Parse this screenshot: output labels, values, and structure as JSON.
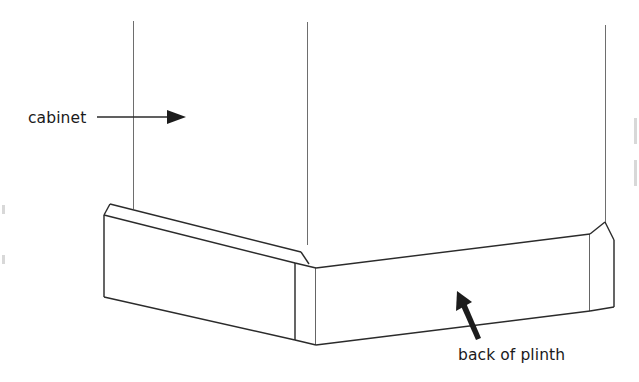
{
  "figure": {
    "background_color": "#ffffff",
    "line_color": "#2b2b2b",
    "text_color": "#1a1a1a",
    "width": 639,
    "height": 382
  },
  "labels": {
    "cabinet": {
      "text": "cabinet",
      "x": 28,
      "y": 123
    },
    "back_of_plinth": {
      "text": "back of plinth",
      "x": 458,
      "y": 360
    }
  },
  "annotations": {
    "cabinet_leader": {
      "name": "horizontal leader with right-pointing arrowhead",
      "from_x": 97,
      "from_y": 117,
      "to_x": 186,
      "to_y": 117,
      "direction": "right"
    },
    "plinth_leader": {
      "name": "diagonal leader with up-left arrowhead",
      "from_x": 479,
      "from_y": 337,
      "to_x": 457,
      "to_y": 291,
      "direction": "up-left"
    }
  },
  "geometry": {
    "cabinet_verticals": [
      {
        "name": "left-cabinet-edge",
        "x": 133,
        "y_top": 21,
        "y_bottom": 207
      },
      {
        "name": "center-cabinet-edge",
        "x": 307,
        "y_top": 22,
        "y_bottom": 243
      },
      {
        "name": "right-cabinet-edge",
        "x": 605,
        "y_top": 25,
        "y_bottom": 228
      }
    ],
    "plinth_left_face": {
      "name": "left plinth front face",
      "top_left_x": 104,
      "top_left_y": 215,
      "top_right_x": 295,
      "top_right_y": 263,
      "bottom_right_x": 295,
      "bottom_right_y": 340,
      "bottom_left_x": 104,
      "bottom_left_y": 297
    },
    "plinth_right_face": {
      "name": "right plinth back face",
      "top_left_x": 316,
      "top_left_y": 268,
      "top_right_x": 590,
      "top_right_y": 234,
      "bottom_right_x": 590,
      "bottom_right_y": 311,
      "bottom_left_x": 316,
      "bottom_left_y": 345
    },
    "corner_chamfer": {
      "name": "outer corner chamfer band",
      "x_left": 295,
      "x_right": 316
    }
  }
}
